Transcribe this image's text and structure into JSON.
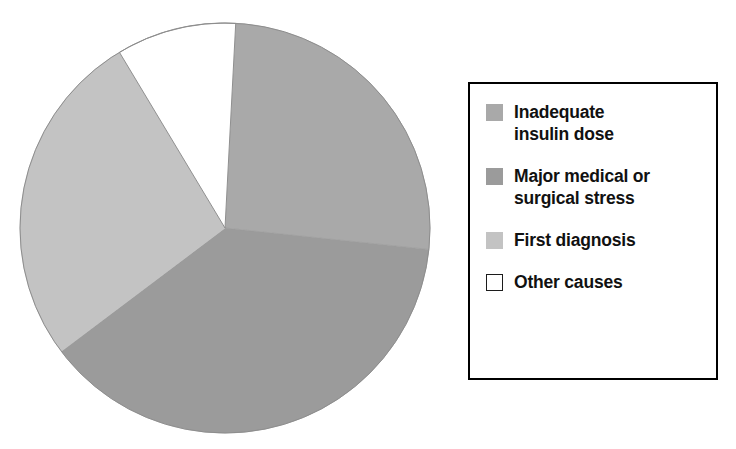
{
  "figure": {
    "background_color": "#ffffff",
    "width": 736,
    "height": 449
  },
  "chart_data": {
    "type": "pie",
    "title": "",
    "subtitle": "",
    "xlabel": "",
    "ylabel": "",
    "grid": false,
    "legend_position": "right",
    "start_angle_deg": 0,
    "direction": "clockwise",
    "rotation_deg": 3,
    "center": {
      "x": 225,
      "y": 228
    },
    "radius": 205,
    "categories": [
      "Inadequate insulin dose",
      "Major medical or surgical stress",
      "First diagnosis",
      "Other causes"
    ],
    "values": [
      26,
      38,
      27,
      9
    ],
    "value_unit": "percent",
    "slices": [
      {
        "label": "Inadequate\ninsulin dose",
        "label_flat": "Inadequate insulin dose",
        "value": 26,
        "color": "#a9a9a9",
        "start_deg": 0,
        "end_deg": 93
      },
      {
        "label": "Major medical or\nsurgical stress",
        "label_flat": "Major medical or surgical stress",
        "value": 38,
        "color": "#9b9b9b",
        "start_deg": 93,
        "end_deg": 230
      },
      {
        "label": "First diagnosis",
        "label_flat": "First diagnosis",
        "value": 27,
        "color": "#c3c3c3",
        "start_deg": 230,
        "end_deg": 326
      },
      {
        "label": "Other causes",
        "label_flat": "Other causes",
        "value": 9,
        "color": "#ffffff",
        "start_deg": 326,
        "end_deg": 360
      }
    ]
  },
  "legend": {
    "border_color": "#000000",
    "background_color": "#ffffff",
    "items": [
      {
        "label": "Inadequate\ninsulin dose",
        "color": "#a9a9a9",
        "outlined": false
      },
      {
        "label": "Major medical or\nsurgical stress",
        "color": "#9b9b9b",
        "outlined": false
      },
      {
        "label": "First diagnosis",
        "color": "#c3c3c3",
        "outlined": false
      },
      {
        "label": "Other causes",
        "color": "#ffffff",
        "outlined": true
      }
    ]
  }
}
